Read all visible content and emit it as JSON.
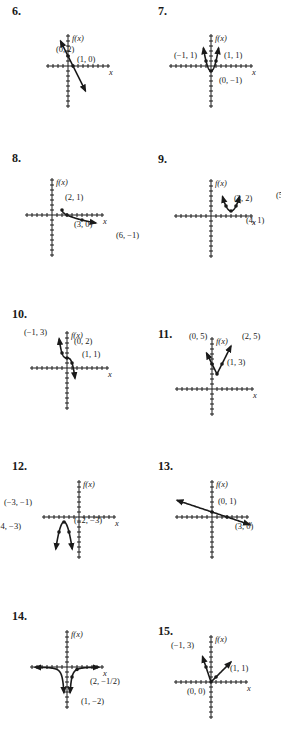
{
  "page": {
    "problems": [
      {
        "number": "6.",
        "y_label": "f(x)",
        "x_label": "x",
        "points": [
          "(0, 2)",
          "(1, 0)"
        ]
      },
      {
        "number": "7.",
        "y_label": "f(x)",
        "x_label": "x",
        "points": [
          "(−1, 1)",
          "(1, 1)",
          "(0, −1)"
        ]
      },
      {
        "number": "8.",
        "y_label": "f(x)",
        "x_label": "x",
        "points": [
          "(2, 1)",
          "(3, 0)",
          "(6, −1)"
        ]
      },
      {
        "number": "9.",
        "y_label": "f(x)",
        "x_label": "x",
        "points": [
          "(3, 2)",
          "(5, 2)",
          "(4, 1)"
        ]
      },
      {
        "number": "10.",
        "y_label": "f(x)",
        "x_label": "x",
        "points": [
          "(−1, 3)",
          "(0, 2)",
          "(1, 1)"
        ]
      },
      {
        "number": "11.",
        "y_label": "f(x)",
        "x_label": "x",
        "points": [
          "(0, 5)",
          "(2, 5)",
          "(1, 3)"
        ]
      },
      {
        "number": "12.",
        "y_label": "f(x)",
        "x_label": "x",
        "points": [
          "(−3, −1)",
          "(−4, −3)",
          "(−2, −3)"
        ]
      },
      {
        "number": "13.",
        "y_label": "f(x)",
        "x_label": "x",
        "points": [
          "(0, 1)",
          "(3, 0)"
        ]
      },
      {
        "number": "14.",
        "y_label": "f(x)",
        "x_label": "x",
        "points": [
          "(2, −1/2)",
          "(1, −2)"
        ]
      },
      {
        "number": "15.",
        "y_label": "f(x)",
        "x_label": "x",
        "points": [
          "(−1, 3)",
          "(1, 1)",
          "(0, 0)"
        ]
      }
    ]
  },
  "chart_data": [
    {
      "id": "6",
      "type": "line",
      "title": "6.",
      "xlabel": "x",
      "ylabel": "f(x)",
      "function": "f(x) = -2x + 2",
      "labeled_points": [
        {
          "x": 0,
          "y": 2
        },
        {
          "x": 1,
          "y": 0
        }
      ]
    },
    {
      "id": "7",
      "type": "line",
      "title": "7.",
      "xlabel": "x",
      "ylabel": "f(x)",
      "function": "f(x) = 2x^2 - 1",
      "labeled_points": [
        {
          "x": -1,
          "y": 1
        },
        {
          "x": 1,
          "y": 1
        },
        {
          "x": 0,
          "y": -1
        }
      ]
    },
    {
      "id": "8",
      "type": "line",
      "title": "8.",
      "xlabel": "x",
      "ylabel": "f(x)",
      "function": "f(x) = -sqrt(x-2) + 1",
      "labeled_points": [
        {
          "x": 2,
          "y": 1
        },
        {
          "x": 3,
          "y": 0
        },
        {
          "x": 6,
          "y": -1
        }
      ]
    },
    {
      "id": "9",
      "type": "line",
      "title": "9.",
      "xlabel": "x",
      "ylabel": "f(x)",
      "function": "f(x) = (x-4)^2 + 1",
      "labeled_points": [
        {
          "x": 3,
          "y": 2
        },
        {
          "x": 5,
          "y": 2
        },
        {
          "x": 4,
          "y": 1
        }
      ]
    },
    {
      "id": "10",
      "type": "line",
      "title": "10.",
      "xlabel": "x",
      "ylabel": "f(x)",
      "function": "f(x) = -x^3 + 2",
      "labeled_points": [
        {
          "x": -1,
          "y": 3
        },
        {
          "x": 0,
          "y": 2
        },
        {
          "x": 1,
          "y": 1
        }
      ]
    },
    {
      "id": "11",
      "type": "line",
      "title": "11.",
      "xlabel": "x",
      "ylabel": "f(x)",
      "function": "f(x) = 2|x-1| + 3",
      "labeled_points": [
        {
          "x": 0,
          "y": 5
        },
        {
          "x": 2,
          "y": 5
        },
        {
          "x": 1,
          "y": 3
        }
      ]
    },
    {
      "id": "12",
      "type": "line",
      "title": "12.",
      "xlabel": "x",
      "ylabel": "f(x)",
      "function": "f(x) = -2(x+3)^2 - 1",
      "labeled_points": [
        {
          "x": -3,
          "y": -1
        },
        {
          "x": -4,
          "y": -3
        },
        {
          "x": -2,
          "y": -3
        }
      ]
    },
    {
      "id": "13",
      "type": "line",
      "title": "13.",
      "xlabel": "x",
      "ylabel": "f(x)",
      "function": "f(x) = -x/3 + 1",
      "labeled_points": [
        {
          "x": 0,
          "y": 1
        },
        {
          "x": 3,
          "y": 0
        }
      ]
    },
    {
      "id": "14",
      "type": "line",
      "title": "14.",
      "xlabel": "x",
      "ylabel": "f(x)",
      "function": "f(x) = -2/x^2",
      "labeled_points": [
        {
          "x": 2,
          "y": -0.5
        },
        {
          "x": 1,
          "y": -2
        }
      ]
    },
    {
      "id": "15",
      "type": "line",
      "title": "15.",
      "xlabel": "x",
      "ylabel": "f(x)",
      "function": "piecewise: f(x) = -3x (x<0), x (x>=0)",
      "labeled_points": [
        {
          "x": -1,
          "y": 3
        },
        {
          "x": 1,
          "y": 1
        },
        {
          "x": 0,
          "y": 0
        }
      ]
    }
  ]
}
